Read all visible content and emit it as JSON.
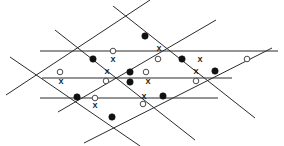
{
  "figure": {
    "type": "geometric-line-arrangement",
    "width": 284,
    "height": 146,
    "background_color": "#ffffff",
    "line_color": "#2b2b2b",
    "dot_fill_color": "#111111",
    "circle_stroke_color": "#4a4a4a",
    "x_mark_color": "#111111",
    "line_count": 9,
    "marker_counts": {
      "filled_dots": 12,
      "open_circles": 12,
      "x_marks": 11
    },
    "lines": [
      {
        "name": "horizontal-top",
        "orientation": "horizontal",
        "x1": 40,
        "y1": 51,
        "x2": 278,
        "y2": 51
      },
      {
        "name": "horizontal-middle",
        "orientation": "horizontal",
        "x1": 42,
        "y1": 78,
        "x2": 232,
        "y2": 78
      },
      {
        "name": "horizontal-bottom",
        "orientation": "horizontal",
        "x1": 40,
        "y1": 98,
        "x2": 218,
        "y2": 98
      },
      {
        "name": "diagonal-down-1",
        "orientation": "down-right",
        "x1": 55,
        "y1": 30,
        "x2": 195,
        "y2": 140
      },
      {
        "name": "diagonal-down-2",
        "orientation": "down-right",
        "x1": 113,
        "y1": 6,
        "x2": 255,
        "y2": 118
      },
      {
        "name": "diagonal-down-3",
        "orientation": "down-right",
        "x1": 10,
        "y1": 57,
        "x2": 140,
        "y2": 146
      },
      {
        "name": "diagonal-up-1",
        "orientation": "up-right",
        "x1": 6,
        "y1": 95,
        "x2": 150,
        "y2": 0
      },
      {
        "name": "diagonal-up-2",
        "orientation": "up-right",
        "x1": 58,
        "y1": 112,
        "x2": 216,
        "y2": 20
      },
      {
        "name": "diagonal-up-3",
        "orientation": "up-right",
        "x1": 84,
        "y1": 143,
        "x2": 272,
        "y2": 48
      }
    ],
    "markers": [
      {
        "name": "dot",
        "kind": "filled-dot",
        "x": 145,
        "y": 36
      },
      {
        "name": "dot",
        "kind": "filled-dot",
        "x": 93,
        "y": 59
      },
      {
        "name": "dot",
        "kind": "filled-dot",
        "x": 182,
        "y": 59
      },
      {
        "name": "dot",
        "kind": "filled-dot",
        "x": 130,
        "y": 72
      },
      {
        "name": "dot",
        "kind": "filled-dot",
        "x": 130,
        "y": 82
      },
      {
        "name": "dot",
        "kind": "filled-dot",
        "x": 215,
        "y": 71
      },
      {
        "name": "dot",
        "kind": "filled-dot",
        "x": 77,
        "y": 97
      },
      {
        "name": "dot",
        "kind": "filled-dot",
        "x": 163,
        "y": 96
      },
      {
        "name": "dot",
        "kind": "filled-dot",
        "x": 112,
        "y": 117
      },
      {
        "name": "circle",
        "kind": "open-circle",
        "x": 113,
        "y": 51
      },
      {
        "name": "circle",
        "kind": "open-circle",
        "x": 158,
        "y": 59
      },
      {
        "name": "circle",
        "kind": "open-circle",
        "x": 247,
        "y": 59
      },
      {
        "name": "circle",
        "kind": "open-circle",
        "x": 60,
        "y": 72
      },
      {
        "name": "circle",
        "kind": "open-circle",
        "x": 106,
        "y": 81
      },
      {
        "name": "circle",
        "kind": "open-circle",
        "x": 146,
        "y": 72
      },
      {
        "name": "circle",
        "kind": "open-circle",
        "x": 196,
        "y": 81
      },
      {
        "name": "circle",
        "kind": "open-circle",
        "x": 95,
        "y": 98
      },
      {
        "name": "circle",
        "kind": "open-circle",
        "x": 143,
        "y": 104
      },
      {
        "name": "x-mark",
        "kind": "x-mark",
        "x": 159,
        "y": 49,
        "label": "X"
      },
      {
        "name": "x-mark",
        "kind": "x-mark",
        "x": 113,
        "y": 60,
        "label": "X"
      },
      {
        "name": "x-mark",
        "kind": "x-mark",
        "x": 200,
        "y": 60,
        "label": "X"
      },
      {
        "name": "x-mark",
        "kind": "x-mark",
        "x": 107,
        "y": 72,
        "label": "X"
      },
      {
        "name": "x-mark",
        "kind": "x-mark",
        "x": 196,
        "y": 72,
        "label": "X"
      },
      {
        "name": "x-mark",
        "kind": "x-mark",
        "x": 61,
        "y": 82,
        "label": "X"
      },
      {
        "name": "x-mark",
        "kind": "x-mark",
        "x": 148,
        "y": 82,
        "label": "X"
      },
      {
        "name": "x-mark",
        "kind": "x-mark",
        "x": 144,
        "y": 97,
        "label": "X"
      },
      {
        "name": "x-mark",
        "kind": "x-mark",
        "x": 95,
        "y": 106,
        "label": "X"
      }
    ]
  }
}
